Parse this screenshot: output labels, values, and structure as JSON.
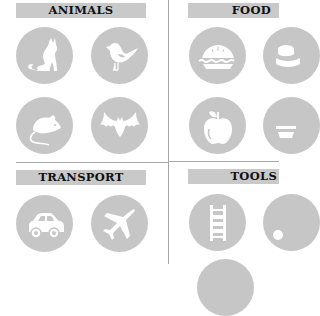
{
  "colors": {
    "panel_gray": "#c9c9c9",
    "circle_gray": "#c6c6c6",
    "icon_white": "#ffffff",
    "divider": "#a8a8a8",
    "text": "#111111"
  },
  "sections": [
    {
      "title": "ANIMALS",
      "icons": [
        "cat-icon",
        "bird-icon",
        "mouse-icon",
        "bat-icon"
      ]
    },
    {
      "title": "FOOD",
      "icons": [
        "pie-icon",
        "cake-icon",
        "apple-icon",
        "food-icon"
      ]
    },
    {
      "title": "TRANSPORT",
      "icons": [
        "car-icon",
        "airplane-icon"
      ]
    },
    {
      "title": "TOOLS",
      "icons": [
        "ladder-icon",
        "tool-icon"
      ]
    }
  ]
}
